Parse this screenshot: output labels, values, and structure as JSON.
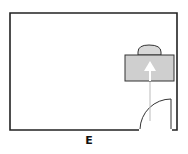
{
  "diagram": {
    "type": "floor-plan",
    "label": "E",
    "elements": [
      {
        "name": "room-walls",
        "icon": "wall-outline"
      },
      {
        "name": "door",
        "icon": "door-swing-arc"
      },
      {
        "name": "desk",
        "icon": "gray-rectangle"
      },
      {
        "name": "chair",
        "icon": "semicircle"
      },
      {
        "name": "path-arrow",
        "icon": "arrow-up",
        "direction": "door to desk"
      }
    ],
    "colors": {
      "wall": "#222222",
      "desk_fill": "#cfcfcf",
      "desk_stroke": "#333333",
      "chair_fill": "#d8d8d8",
      "arrow": "#ffffff",
      "path_line": "#bbbbbb"
    }
  }
}
